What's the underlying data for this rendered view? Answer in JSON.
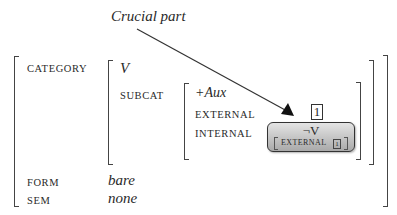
{
  "annotation": {
    "label": "Crucial part"
  },
  "avm": {
    "category": {
      "label": "CATEGORY",
      "head_value": "V",
      "subcat": {
        "label": "SUBCAT",
        "aux_value": "+Aux",
        "external": {
          "label": "EXTERNAL",
          "tag": "1"
        },
        "internal": {
          "label": "INTERNAL",
          "value": "¬V",
          "inner": {
            "label": "EXTERNAL",
            "tag": "1"
          }
        }
      }
    },
    "form": {
      "label": "FORM",
      "value": "bare"
    },
    "sem": {
      "label": "SEM",
      "value": "none"
    }
  }
}
